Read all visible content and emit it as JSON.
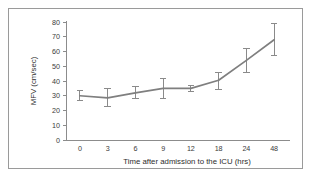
{
  "figure": {
    "border_color": "#9a9a9a",
    "background": "#ffffff"
  },
  "chart_data": {
    "type": "line",
    "title": "",
    "subtitle": "",
    "xlabel": "Time after admission to the ICU (hrs)",
    "ylabel": "MFV (cm/sec)",
    "categories": [
      "0",
      "3",
      "6",
      "9",
      "12",
      "18",
      "24",
      "48"
    ],
    "x_tick_labels": [
      "0",
      "3",
      "6",
      "9",
      "12",
      "18",
      "24",
      "48"
    ],
    "y_tick_labels": [
      "0",
      "10",
      "20",
      "30",
      "40",
      "50",
      "60",
      "70",
      "80"
    ],
    "y_ticks": [
      0,
      10,
      20,
      30,
      40,
      50,
      60,
      70,
      80
    ],
    "ylim": [
      0,
      80
    ],
    "grid": false,
    "legend": false,
    "legend_position": "none",
    "line_color": "#7f7f7f",
    "errorbar_color": "#8a8a8a",
    "series": [
      {
        "name": "MFV",
        "values": [
          30,
          28.5,
          32,
          35,
          35,
          40.5,
          54,
          68
        ],
        "err_low": [
          27,
          22.5,
          28,
          28,
          33,
          34,
          46,
          57
        ],
        "err_high": [
          33.5,
          35,
          36,
          41.5,
          37,
          46,
          62,
          79
        ]
      }
    ]
  }
}
